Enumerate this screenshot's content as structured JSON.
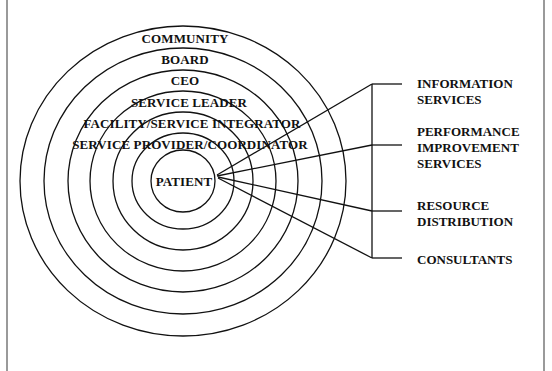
{
  "diagram": {
    "type": "concentric-rings-with-bracket",
    "center_label": "PATIENT",
    "rings_outer_to_inner": [
      {
        "label": "COMMUNITY"
      },
      {
        "label": "BOARD"
      },
      {
        "label": "CEO"
      },
      {
        "label": "SERVICE LEADER"
      },
      {
        "label": "FACILITY/SERVICE INTEGRATOR"
      },
      {
        "label": "SERVICE PROVIDER/COORDINATOR"
      }
    ],
    "support_services": [
      {
        "lines": [
          "INFORMATION",
          "SERVICES"
        ]
      },
      {
        "lines": [
          "PERFORMANCE",
          "IMPROVEMENT",
          "SERVICES"
        ]
      },
      {
        "lines": [
          "RESOURCE",
          "DISTRIBUTION"
        ]
      },
      {
        "lines": [
          "CONSULTANTS"
        ]
      }
    ],
    "colors": {
      "stroke": "#111111",
      "text": "#111111",
      "frame": "#9a9a9a",
      "background": "#ffffff"
    }
  }
}
